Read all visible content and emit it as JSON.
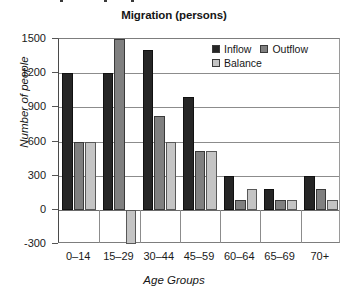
{
  "chart_data": {
    "type": "bar",
    "title": "Migration (persons)",
    "xlabel": "Age Groups",
    "ylabel": "Number of people",
    "categories": [
      "0–14",
      "15–29",
      "30–44",
      "45–59",
      "60–64",
      "65–69",
      "70+"
    ],
    "series": [
      {
        "name": "Inflow",
        "color": "#262626",
        "values": [
          1200,
          1200,
          1400,
          990,
          300,
          185,
          300
        ]
      },
      {
        "name": "Outflow",
        "color": "#808080",
        "values": [
          600,
          1500,
          820,
          520,
          90,
          90,
          185
        ]
      },
      {
        "name": "Balance",
        "color": "#c4c4c4",
        "values": [
          600,
          -300,
          600,
          520,
          185,
          90,
          90
        ]
      }
    ],
    "ylim": [
      -300,
      1500
    ],
    "yticks": [
      1500,
      1200,
      900,
      600,
      300,
      0,
      -300
    ],
    "ytick_labels": [
      "1500",
      "1200",
      "900",
      "600",
      "300",
      "0",
      "-300"
    ],
    "grid": true,
    "legend_position": "top-right"
  },
  "legend": {
    "entries": [
      {
        "label": "Inflow"
      },
      {
        "label": "Outflow"
      },
      {
        "label": "Balance"
      }
    ]
  }
}
